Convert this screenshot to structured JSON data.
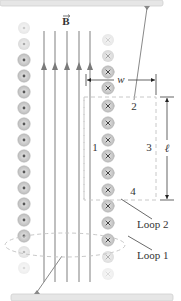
{
  "figure": {
    "field_label": "B",
    "field_vector_mark": "→",
    "dimensions": {
      "width_label": "w",
      "length_label": "ℓ"
    },
    "loop2_sides": [
      "1",
      "2",
      "3",
      "4"
    ],
    "loop_labels": {
      "loop2": "Loop 2",
      "loop1": "Loop 1"
    },
    "left_column": {
      "symbol": "dot",
      "meaning": "current out of page",
      "count": 14
    },
    "right_column": {
      "symbol": "cross",
      "meaning": "current into page",
      "count": 14
    },
    "field_lines": {
      "count": 5,
      "direction": "up"
    },
    "colors": {
      "field_line": "#8a8a8a",
      "coil_fill": "#cfcfcf",
      "coil_ring": "#b5b5b5",
      "dashed_loop": "#c8c8c8",
      "plate": "#e6e6e6",
      "text": "#333333"
    }
  }
}
